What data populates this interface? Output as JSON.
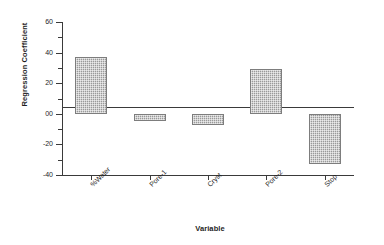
{
  "chart_data": {
    "type": "bar",
    "title": "",
    "xlabel": "Variable",
    "ylabel": "Regression Coefficient",
    "categories": [
      "%Water",
      "Pore-1",
      "Cryst",
      "Pore-2",
      "Stop"
    ],
    "values": [
      37,
      -5,
      -7,
      29,
      -33
    ],
    "ylim": [
      -40,
      60
    ],
    "yticks": [
      60,
      40,
      20,
      0,
      -20,
      -40
    ],
    "ytick_labels": [
      "60",
      "40",
      "20",
      "00",
      "-20",
      "-40"
    ],
    "grid": false,
    "legend": false,
    "bar_color": "#9a9a9a",
    "bar_edge_color": "#7d7d7d",
    "axis_color": "#3a3a3a",
    "series": [
      {
        "name": "Regression Coefficient",
        "values": [
          37,
          -5,
          -7,
          29,
          -33
        ]
      }
    ],
    "annotations": []
  }
}
